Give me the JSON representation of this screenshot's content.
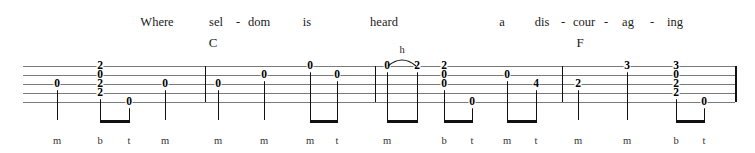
{
  "layout": {
    "width": 755,
    "height": 153,
    "staff": {
      "left": 23,
      "right": 735,
      "line_ys": [
        66,
        75,
        84,
        93,
        102
      ],
      "line_count": 5,
      "line_color": "#7a7a7a"
    },
    "barline_xs": [
      205,
      375,
      562
    ],
    "end_barline_x": 735,
    "beam_y": 120,
    "fingering_y": 136,
    "lyric_y": 16,
    "chord_y": 36
  },
  "lyrics": {
    "syllables": [
      {
        "text": "Where",
        "x": 157
      },
      {
        "text": "sel",
        "x": 216
      },
      {
        "text": "dom",
        "x": 259
      },
      {
        "text": "is",
        "x": 307
      },
      {
        "text": "heard",
        "x": 384
      },
      {
        "text": "a",
        "x": 502
      },
      {
        "text": "dis",
        "x": 542
      },
      {
        "text": "cour",
        "x": 584
      },
      {
        "text": "ag",
        "x": 628
      },
      {
        "text": "ing",
        "x": 675
      }
    ],
    "hyphens": [
      {
        "text": "-",
        "x": 238
      },
      {
        "text": "-",
        "x": 563
      },
      {
        "text": "-",
        "x": 606
      },
      {
        "text": "-",
        "x": 652
      }
    ]
  },
  "chords": [
    {
      "name": "C",
      "x": 213
    },
    {
      "name": "F",
      "x": 580
    }
  ],
  "tab_notes": [
    {
      "fret": "0",
      "x": 57,
      "string": 3
    },
    {
      "fret": "2",
      "x": 100,
      "string": 1
    },
    {
      "fret": "0",
      "x": 100,
      "string": 2
    },
    {
      "fret": "2",
      "x": 100,
      "string": 3
    },
    {
      "fret": "2",
      "x": 100,
      "string": 4
    },
    {
      "fret": "0",
      "x": 129,
      "string": 5
    },
    {
      "fret": "0",
      "x": 165,
      "string": 3
    },
    {
      "fret": "0",
      "x": 218,
      "string": 3
    },
    {
      "fret": "0",
      "x": 264,
      "string": 2
    },
    {
      "fret": "0",
      "x": 310,
      "string": 1
    },
    {
      "fret": "0",
      "x": 337,
      "string": 2
    },
    {
      "fret": "0",
      "x": 387,
      "string": 1
    },
    {
      "fret": "2",
      "x": 417,
      "string": 1
    },
    {
      "fret": "2",
      "x": 444,
      "string": 1
    },
    {
      "fret": "0",
      "x": 444,
      "string": 2
    },
    {
      "fret": "0",
      "x": 444,
      "string": 3
    },
    {
      "fret": "0",
      "x": 472,
      "string": 5
    },
    {
      "fret": "0",
      "x": 507,
      "string": 2
    },
    {
      "fret": "4",
      "x": 536,
      "string": 3
    },
    {
      "fret": "2",
      "x": 578,
      "string": 3
    },
    {
      "fret": "3",
      "x": 627,
      "string": 1
    },
    {
      "fret": "3",
      "x": 676,
      "string": 1
    },
    {
      "fret": "0",
      "x": 676,
      "string": 2
    },
    {
      "fret": "2",
      "x": 676,
      "string": 3
    },
    {
      "fret": "2",
      "x": 676,
      "string": 4
    },
    {
      "fret": "0",
      "x": 704,
      "string": 5
    }
  ],
  "stems": [
    {
      "x": 57,
      "top": 84,
      "bottom": 120
    },
    {
      "x": 100,
      "top": 93,
      "bottom": 120
    },
    {
      "x": 129,
      "top": 102,
      "bottom": 120
    },
    {
      "x": 165,
      "top": 84,
      "bottom": 120
    },
    {
      "x": 218,
      "top": 84,
      "bottom": 120
    },
    {
      "x": 264,
      "top": 75,
      "bottom": 120
    },
    {
      "x": 310,
      "top": 66,
      "bottom": 120
    },
    {
      "x": 337,
      "top": 75,
      "bottom": 120
    },
    {
      "x": 387,
      "top": 66,
      "bottom": 120
    },
    {
      "x": 417,
      "top": 66,
      "bottom": 120
    },
    {
      "x": 444,
      "top": 84,
      "bottom": 120
    },
    {
      "x": 472,
      "top": 102,
      "bottom": 120
    },
    {
      "x": 507,
      "top": 75,
      "bottom": 120
    },
    {
      "x": 536,
      "top": 84,
      "bottom": 120
    },
    {
      "x": 578,
      "top": 84,
      "bottom": 120
    },
    {
      "x": 627,
      "top": 66,
      "bottom": 120
    },
    {
      "x": 676,
      "top": 93,
      "bottom": 120
    },
    {
      "x": 704,
      "top": 102,
      "bottom": 120
    }
  ],
  "beams": [
    {
      "x1": 100,
      "x2": 129
    },
    {
      "x1": 310,
      "x2": 337
    },
    {
      "x1": 387,
      "x2": 417
    },
    {
      "x1": 444,
      "x2": 472
    },
    {
      "x1": 507,
      "x2": 536
    },
    {
      "x1": 676,
      "x2": 704
    }
  ],
  "slurs": [
    {
      "x1": 387,
      "x2": 417,
      "label": "h",
      "label_x": 402,
      "label_y": 45
    }
  ],
  "fingering": [
    {
      "text": "m",
      "x": 57
    },
    {
      "text": "b",
      "x": 100
    },
    {
      "text": "t",
      "x": 129
    },
    {
      "text": "m",
      "x": 165
    },
    {
      "text": "m",
      "x": 218
    },
    {
      "text": "m",
      "x": 264
    },
    {
      "text": "m",
      "x": 310
    },
    {
      "text": "t",
      "x": 337
    },
    {
      "text": "m",
      "x": 387
    },
    {
      "text": "b",
      "x": 444
    },
    {
      "text": "t",
      "x": 472
    },
    {
      "text": "m",
      "x": 507
    },
    {
      "text": "t",
      "x": 536
    },
    {
      "text": "m",
      "x": 578
    },
    {
      "text": "m",
      "x": 627
    },
    {
      "text": "b",
      "x": 676
    },
    {
      "text": "t",
      "x": 704
    }
  ]
}
